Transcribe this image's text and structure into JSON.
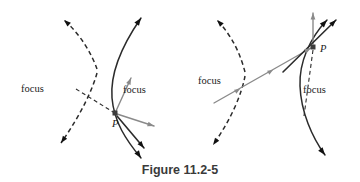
{
  "figure": {
    "caption": "Figure 11.2-5",
    "colors": {
      "curve": "#2b2b2b",
      "ray_gray": "#8a8a8a",
      "ray_dark": "#2b2b2b",
      "focus_dot": "#111111",
      "point_marker": "#3c3c3c",
      "caption_text": "#3a3a3a",
      "background": "#ffffff"
    },
    "panels": [
      {
        "id": "left-panel",
        "name": "hyperbola-reflection-left",
        "labels": {
          "focus_far": "focus",
          "focus_near": "focus",
          "point": "P"
        },
        "label_positions": {
          "focus_far": {
            "x": 21,
            "y": 92
          },
          "focus_near": {
            "x": 123,
            "y": 93
          },
          "point": {
            "x": 112,
            "y": 127
          }
        },
        "markers": {
          "focus_far_dot": {
            "x": 71,
            "y": 89,
            "r": 3.0
          },
          "point_square": {
            "x": 115,
            "y": 113,
            "size": 5.0
          }
        },
        "branch_dashed": "M 97,69 C 92,55 82,36 64,20",
        "branch_dashed2": "M 97,73 C 93,88 82,113 61,143",
        "branch_solid": "M 141,18 C 123,44 110,73 112,98 C 114,122 126,140 141,158",
        "incident_dashed_ray": "M 76,89 L 113,112",
        "gray_ray_to_focus": "M 116,111 L 131,78",
        "gray_ray_right": "M 117,114 L 154,126",
        "dark_ray_down": "M 117,116 L 144,148",
        "arrow_tips": [
          {
            "name": "dashed-branch-upper-arrow",
            "x": 64,
            "y": 20,
            "angle": -138
          },
          {
            "name": "dashed-branch-lower-arrow",
            "x": 61,
            "y": 143,
            "angle": 125
          },
          {
            "name": "solid-branch-upper-arrow",
            "x": 141,
            "y": 18,
            "angle": -55
          },
          {
            "name": "solid-branch-lower-arrow",
            "x": 141,
            "y": 158,
            "angle": 55
          },
          {
            "name": "gray-focus-ray-arrow",
            "x": 131,
            "y": 78,
            "angle": -66
          },
          {
            "name": "gray-right-ray-arrow",
            "x": 154,
            "y": 126,
            "angle": 18
          },
          {
            "name": "dark-down-ray-arrow",
            "x": 144,
            "y": 148,
            "angle": 50
          }
        ]
      },
      {
        "id": "right-panel",
        "name": "hyperbola-reflection-right",
        "labels": {
          "focus_left": "focus",
          "focus_right": "focus",
          "point": "P"
        },
        "label_positions": {
          "focus_left": {
            "x": 198,
            "y": 84
          },
          "focus_right": {
            "x": 303,
            "y": 93
          },
          "point": {
            "x": 320,
            "y": 52
          }
        },
        "markers": {
          "focus_right_dot": {
            "x": 296,
            "y": 89,
            "r": 3.0
          },
          "point_square": {
            "x": 313,
            "y": 47,
            "size": 5.0
          }
        },
        "branch_dashed": "M 245,72 C 241,57 234,38 217,20",
        "branch_dashed2": "M 245,76 C 242,93 232,118 213,145",
        "branch_solid": "M 327,20 C 310,38 299,62 300,86 C 301,112 312,137 325,155",
        "gray_incident_ray": "M 214,103 L 311,48",
        "gray_vertical_ray": "M 313,44 L 313,13",
        "dashed_vertical_to_focus": "M 313,50 L 304,116",
        "dark_tangent_ray": "M 283,72 L 336,20",
        "arrow_tips": [
          {
            "name": "dashed-branch-upper-arrow",
            "x": 217,
            "y": 20,
            "angle": -134
          },
          {
            "name": "dashed-branch-lower-arrow",
            "x": 213,
            "y": 145,
            "angle": 126
          },
          {
            "name": "solid-branch-upper-arrow",
            "x": 327,
            "y": 20,
            "angle": -47
          },
          {
            "name": "solid-branch-lower-arrow",
            "x": 325,
            "y": 155,
            "angle": 52
          },
          {
            "name": "gray-incident-ray-arrow",
            "x": 311,
            "y": 48,
            "angle": -30
          },
          {
            "name": "gray-vertical-ray-arrow",
            "x": 313,
            "y": 13,
            "angle": -90
          },
          {
            "name": "dark-tangent-ray-arrow",
            "x": 336,
            "y": 20,
            "angle": -45
          }
        ],
        "ray_midpoint_arrows": [
          {
            "name": "gray-ray-mid-arrow-1",
            "x": 240,
            "y": 89,
            "angle": -30
          },
          {
            "name": "gray-ray-mid-arrow-2",
            "x": 273,
            "y": 70,
            "angle": -30
          }
        ]
      }
    ]
  }
}
